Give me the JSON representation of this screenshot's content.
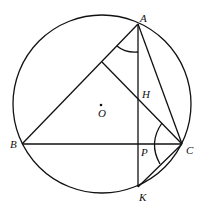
{
  "diagram": {
    "type": "geometry",
    "circle": {
      "center": "O",
      "cx": 102,
      "cy": 104,
      "r": 89
    },
    "points": {
      "A": {
        "label": "A",
        "x": 138,
        "y": 24
      },
      "B": {
        "label": "B",
        "x": 22,
        "y": 144
      },
      "C": {
        "label": "C",
        "x": 182,
        "y": 144
      },
      "H": {
        "label": "H",
        "x": 138,
        "y": 98
      },
      "P": {
        "label": "P",
        "x": 138,
        "y": 144
      },
      "K": {
        "label": "K",
        "x": 138,
        "y": 187
      },
      "O": {
        "label": "O",
        "x": 101,
        "y": 105
      }
    },
    "segments": [
      "AB",
      "BC",
      "CA",
      "AK",
      "C-foot(AB)",
      "CK"
    ],
    "angle_marks": [
      "angle BAP",
      "angle HCK"
    ]
  }
}
